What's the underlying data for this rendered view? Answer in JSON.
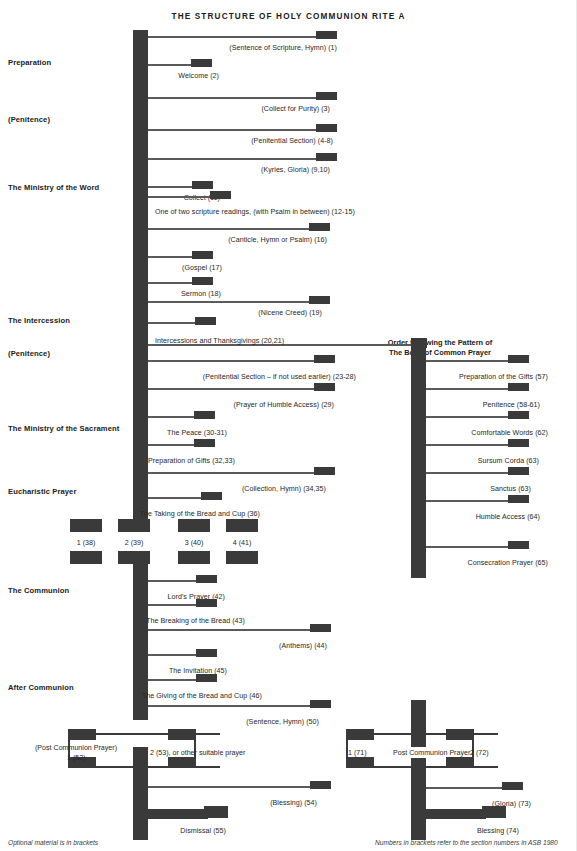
{
  "title": "THE  STRUCTURE  OF  HOLY  COMMUNION  RITE  A",
  "colors": {
    "ink": "#3a3a3a",
    "rule": "#5a5a5a",
    "text": "#272727",
    "background": "#ffffff"
  },
  "section_labels": [
    {
      "label": "Preparation",
      "top": 61
    },
    {
      "label": "(Penitence)",
      "top": 118
    },
    {
      "label": "The Ministry of the Word",
      "top": 186
    },
    {
      "label": "The Intercession",
      "top": 319
    },
    {
      "label": "(Penitence)",
      "top": 352
    },
    {
      "label": "The Ministry of the Sacrament",
      "top": 427
    },
    {
      "label": "Eucharistic Prayer",
      "top": 490
    },
    {
      "label": "The Communion",
      "top": 589
    },
    {
      "label": "After Communion",
      "top": 686
    }
  ],
  "right_column_heading": {
    "line1": "Order following the Pattern of",
    "line2": "The Book of Common Prayer"
  },
  "main_branches": [
    {
      "text": "(Sentence of Scripture, Hymn) (1)",
      "y": 36,
      "capEnd": 337,
      "align": "right",
      "textX": 337
    },
    {
      "text": "Welcome (2)",
      "y": 64,
      "capEnd": 212,
      "align": "right",
      "textX": 219
    },
    {
      "text": "(Collect for Purity) (3)",
      "y": 97,
      "capEnd": 337,
      "align": "right",
      "textX": 330
    },
    {
      "text": "(Penitential Section) (4-8)",
      "y": 129,
      "capEnd": 337,
      "align": "right",
      "textX": 333
    },
    {
      "text": "(Kyries, Gloria) (9,10)",
      "y": 158,
      "capEnd": 337,
      "align": "right",
      "textX": 330
    },
    {
      "text": "Collect (11)",
      "y": 186,
      "capEnd": 213,
      "align": "right",
      "textX": 220
    },
    {
      "text": "One of two scripture readings, (with Psalm in between) (12-15)",
      "y": 213,
      "capEnd": 231,
      "align": "left",
      "textX": 155
    },
    {
      "text": "(Canticle, Hymn or Psalm) (16)",
      "y": 241,
      "capEnd": 332,
      "align": "right",
      "textX": 327
    },
    {
      "text": "(Gospel (17)",
      "y": 269,
      "capEnd": 213,
      "align": "right",
      "textX": 222
    },
    {
      "text": "Sermon (18)",
      "y": 297,
      "capEnd": 213,
      "align": "right",
      "textX": 221
    },
    {
      "text": "(Nicene Creed) (19)",
      "y": 325,
      "capEnd": 327,
      "align": "right",
      "textX": 322
    },
    {
      "text": "Intercessions and Thanksgivings (20,21)",
      "y": 352,
      "capEnd": 216,
      "align": "left",
      "textX": 155
    },
    {
      "text": "",
      "y": 382,
      "capEnd": 0,
      "align": "none",
      "textX": 0
    },
    {
      "text": "(Penitential Section – if not used earlier) (23-28)",
      "y": 391,
      "capEnd": 336,
      "align": "right",
      "textX": 356
    },
    {
      "text": "(Prayer of Humble Access) (29)",
      "y": 419,
      "capEnd": 336,
      "align": "right",
      "textX": 334
    },
    {
      "text": "The Peace (30-31)",
      "y": 447,
      "capEnd": 214,
      "align": "right",
      "textX": 227
    },
    {
      "text": "Preparation of Gifts (32,33)",
      "y": 475,
      "capEnd": 214,
      "align": "right",
      "textX": 235
    },
    {
      "text": "(Collection, Hymn) (34,35)",
      "y": 503,
      "capEnd": 336,
      "align": "right",
      "textX": 326
    },
    {
      "text": "The Taking of the Bread and Cup (36)",
      "y": 531,
      "capEnd": 222,
      "align": "right",
      "textX": 260
    },
    {
      "text": "Lord's Prayer (42)",
      "y": 589,
      "capEnd": 218,
      "align": "right",
      "textX": 225
    },
    {
      "text": "The Breaking of the Bread (43)",
      "y": 617,
      "capEnd": 218,
      "align": "right",
      "textX": 245
    },
    {
      "text": "(Anthems) (44)",
      "y": 645,
      "capEnd": 332,
      "align": "right",
      "textX": 327
    },
    {
      "text": "The Invitation (45)",
      "y": 673,
      "capEnd": 218,
      "align": "right",
      "textX": 227
    },
    {
      "text": "The Giving of the Bread and Cup (46)",
      "y": 701,
      "capEnd": 218,
      "align": "right",
      "textX": 262
    },
    {
      "text": "(Sentence, Hymn) (50)",
      "y": 729,
      "capEnd": 332,
      "align": "right",
      "textX": 319
    },
    {
      "text": "(Blessing) (54)",
      "y": 804,
      "capEnd": 332,
      "align": "right",
      "textX": 317
    },
    {
      "text": "Dismissal (55)",
      "y": 832,
      "capEnd": 222,
      "align": "right",
      "textX": 226
    }
  ],
  "bcp_branches": [
    {
      "text": "Preparation of the Gifts (57)",
      "y": 375,
      "capEnd": 527,
      "textX": 548
    },
    {
      "text": "Penitence (58-61)",
      "y": 403,
      "capEnd": 527,
      "textX": 540
    },
    {
      "text": "Comfortable Words (62)",
      "y": 431,
      "capEnd": 527,
      "textX": 548
    },
    {
      "text": "Sursum Corda (63)",
      "y": 459,
      "capEnd": 527,
      "textX": 539
    },
    {
      "text": "Sanctus (63)",
      "y": 487,
      "capEnd": 527,
      "textX": 531
    },
    {
      "text": "Humble Access (64)",
      "y": 515,
      "capEnd": 527,
      "textX": 540
    },
    {
      "text": "Consecration Prayer (65)",
      "y": 561,
      "capEnd": 527,
      "textX": 548
    },
    {
      "text": "(Gloria) (73)",
      "y": 802,
      "capEnd": 527,
      "textX": 531
    },
    {
      "text": "Blessing (74)",
      "y": 831,
      "capEnd": 513,
      "textX": 518
    }
  ],
  "eucharistic_prayer": {
    "options": [
      {
        "label": "1 (38)",
        "x": 85
      },
      {
        "label": "2 (39)",
        "x": 134
      },
      {
        "label": "3 (40)",
        "x": 194
      },
      {
        "label": "4 (41)",
        "x": 240
      }
    ]
  },
  "post_communion_left": {
    "caption_line1": "(Post Communion Prayer)",
    "caption_line2": "1 (52)",
    "alt_label": "2 (53), or other suitable prayer"
  },
  "post_communion_right": {
    "left_label": "1 (71)",
    "title": "Post Communion Prayer",
    "right_label": "2 (72)"
  },
  "footnotes": {
    "left": "Optional material is in brackets",
    "right": "Numbers in brackets refer to the section numbers in ASB 1980"
  }
}
